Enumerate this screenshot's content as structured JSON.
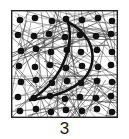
{
  "figure": {
    "caption": "3",
    "panel": {
      "width": 107,
      "height": 108,
      "border_color": "#222222",
      "border_width": 1.4,
      "background_color": "#ffffff"
    },
    "texture": {
      "name": "random-line-mesh",
      "description": "dense network of thin randomly oriented straight line segments filling the square",
      "line_color": "#3a3a3a",
      "line_width": 0.45,
      "segment_count": 150,
      "seed": 20240517
    },
    "dots": {
      "name": "black-dot-array",
      "color": "#111111",
      "radius": 3.3,
      "rows": 7,
      "cols": 7,
      "spacing_x": 15.5,
      "spacing_y": 15.5,
      "jitter": 2.6,
      "count": 49,
      "positions": [
        [
          9,
          10
        ],
        [
          24,
          8
        ],
        [
          41,
          11
        ],
        [
          55,
          9
        ],
        [
          71,
          10
        ],
        [
          87,
          8
        ],
        [
          101,
          11
        ],
        [
          7,
          25
        ],
        [
          23,
          26
        ],
        [
          38,
          24
        ],
        [
          54,
          27
        ],
        [
          69,
          25
        ],
        [
          85,
          26
        ],
        [
          100,
          24
        ],
        [
          10,
          41
        ],
        [
          25,
          39
        ],
        [
          40,
          42
        ],
        [
          56,
          40
        ],
        [
          70,
          42
        ],
        [
          86,
          40
        ],
        [
          101,
          42
        ],
        [
          8,
          56
        ],
        [
          24,
          57
        ],
        [
          39,
          55
        ],
        [
          55,
          58
        ],
        [
          71,
          56
        ],
        [
          87,
          57
        ],
        [
          100,
          55
        ],
        [
          10,
          72
        ],
        [
          25,
          70
        ],
        [
          41,
          73
        ],
        [
          56,
          71
        ],
        [
          70,
          73
        ],
        [
          86,
          71
        ],
        [
          101,
          72
        ],
        [
          7,
          87
        ],
        [
          23,
          88
        ],
        [
          39,
          86
        ],
        [
          54,
          89
        ],
        [
          69,
          87
        ],
        [
          85,
          88
        ],
        [
          100,
          86
        ],
        [
          9,
          101
        ],
        [
          25,
          99
        ],
        [
          40,
          102
        ],
        [
          55,
          100
        ],
        [
          71,
          101
        ],
        [
          86,
          99
        ],
        [
          101,
          102
        ]
      ]
    },
    "crescent": {
      "name": "crescent-outline",
      "stroke_color": "#111111",
      "stroke_width": 2.6,
      "fill": "none",
      "top_vertex": [
        57,
        12
      ],
      "bottom_vertex": [
        19,
        90
      ],
      "outer_extreme": [
        81,
        50
      ],
      "inner_extreme": [
        53,
        55
      ],
      "outer_path": "M 57 12 C 76 22, 84 38, 81 53 C 78 70, 58 86, 19 90",
      "inner_path": "M 57 12 C 62 30, 56 46, 50 58 C 42 73, 30 84, 19 90"
    }
  }
}
